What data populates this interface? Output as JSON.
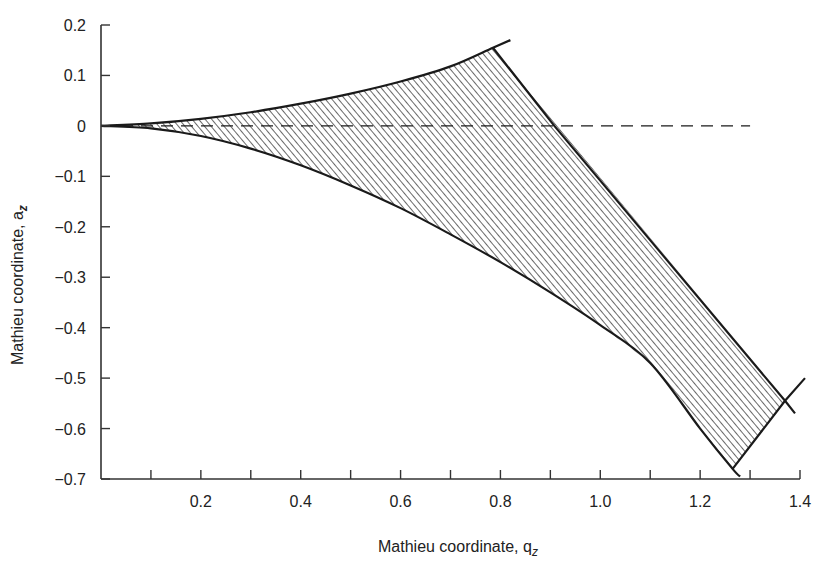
{
  "chart_data": {
    "type": "area",
    "title": "",
    "xlabel": "Mathieu coordinate, q",
    "xlabel_sub": "z",
    "ylabel": "Mathieu coordinate, a",
    "ylabel_sub": "z",
    "xlim": [
      0,
      1.4
    ],
    "ylim": [
      -0.7,
      0.2
    ],
    "x_ticks": [
      0.1,
      0.2,
      0.3,
      0.4,
      0.5,
      0.6,
      0.7,
      0.8,
      0.9,
      1.0,
      1.1,
      1.2,
      1.3,
      1.4
    ],
    "x_tick_labels": [
      {
        "value": 0.2,
        "label": "0.2"
      },
      {
        "value": 0.4,
        "label": "0.4"
      },
      {
        "value": 0.6,
        "label": "0.6"
      },
      {
        "value": 0.8,
        "label": "0.8"
      },
      {
        "value": 1.0,
        "label": "1.0"
      },
      {
        "value": 1.2,
        "label": "1.2"
      },
      {
        "value": 1.4,
        "label": "1.4"
      }
    ],
    "y_ticks": [
      {
        "value": 0.2,
        "label": "0.2"
      },
      {
        "value": 0.1,
        "label": "0.1"
      },
      {
        "value": 0,
        "label": "0"
      },
      {
        "value": -0.1,
        "label": "−0.1"
      },
      {
        "value": -0.2,
        "label": "−0.2"
      },
      {
        "value": -0.3,
        "label": "−0.3"
      },
      {
        "value": -0.4,
        "label": "−0.4"
      },
      {
        "value": -0.5,
        "label": "−0.5"
      },
      {
        "value": -0.6,
        "label": "−0.6"
      },
      {
        "value": -0.7,
        "label": "−0.7"
      }
    ],
    "grid": false,
    "legend": null,
    "series": [
      {
        "name": "upper stability boundary (a_z upper)",
        "style": "solid",
        "x": [
          0,
          0.1,
          0.2,
          0.3,
          0.4,
          0.5,
          0.6,
          0.7,
          0.785,
          0.82
        ],
        "y": [
          0,
          0.005,
          0.014,
          0.027,
          0.044,
          0.064,
          0.088,
          0.118,
          0.155,
          0.17
        ]
      },
      {
        "name": "lower stability boundary (a_z lower)",
        "style": "solid",
        "x": [
          0,
          0.1,
          0.2,
          0.3,
          0.4,
          0.5,
          0.6,
          0.7,
          0.8,
          0.9,
          1.0,
          1.1,
          1.2,
          1.265,
          1.28
        ],
        "y": [
          0,
          -0.005,
          -0.02,
          -0.045,
          -0.078,
          -0.118,
          -0.163,
          -0.215,
          -0.27,
          -0.33,
          -0.395,
          -0.47,
          -0.6,
          -0.68,
          -0.695
        ]
      },
      {
        "name": "right boundary (upper-right edge)",
        "style": "solid",
        "x": [
          0.785,
          0.908,
          1.37,
          1.39
        ],
        "y": [
          0.155,
          0,
          -0.545,
          -0.57
        ]
      },
      {
        "name": "right boundary (lower-right edge)",
        "style": "solid",
        "x": [
          1.265,
          1.37,
          1.41
        ],
        "y": [
          -0.68,
          -0.545,
          -0.5
        ]
      },
      {
        "name": "a_z = 0 reference",
        "style": "dashed",
        "x": [
          0,
          1.3
        ],
        "y": [
          0,
          0
        ]
      }
    ],
    "shaded_region": {
      "name": "stability region",
      "fill": "hatched",
      "vertices": [
        [
          0,
          0
        ],
        [
          0.785,
          0.155
        ],
        [
          1.37,
          -0.545
        ],
        [
          1.265,
          -0.68
        ]
      ]
    }
  }
}
